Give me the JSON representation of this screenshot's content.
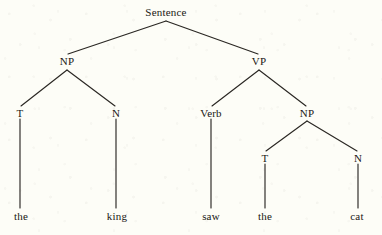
{
  "diagram": {
    "type": "constituency-syntax-tree",
    "sentence_text": "the king saw the cat",
    "background_color": "#fdfdf7",
    "ink_color": "#1a1814",
    "line_color": "#2a2723",
    "nodes": [
      {
        "id": "S",
        "label": "Sentence",
        "x": 166,
        "y": 12,
        "kind": "root"
      },
      {
        "id": "NP1",
        "label": "NP",
        "x": 67,
        "y": 61,
        "kind": "phrase"
      },
      {
        "id": "VP",
        "label": "VP",
        "x": 259,
        "y": 61,
        "kind": "phrase"
      },
      {
        "id": "T1",
        "label": "T",
        "x": 20,
        "y": 113,
        "kind": "terminal-cat"
      },
      {
        "id": "N1",
        "label": "N",
        "x": 116,
        "y": 113,
        "kind": "terminal-cat"
      },
      {
        "id": "Verb",
        "label": "Verb",
        "x": 211,
        "y": 113,
        "kind": "terminal-cat"
      },
      {
        "id": "NP2",
        "label": "NP",
        "x": 307,
        "y": 113,
        "kind": "phrase"
      },
      {
        "id": "T2",
        "label": "T",
        "x": 265,
        "y": 158,
        "kind": "terminal-cat"
      },
      {
        "id": "N2",
        "label": "N",
        "x": 358,
        "y": 158,
        "kind": "terminal-cat"
      }
    ],
    "leaves": [
      {
        "id": "w-the1",
        "label": "the",
        "x": 21,
        "y": 216,
        "parent": "T1"
      },
      {
        "id": "w-king",
        "label": "king",
        "x": 117,
        "y": 216,
        "parent": "N1"
      },
      {
        "id": "w-saw",
        "label": "saw",
        "x": 211,
        "y": 216,
        "parent": "Verb"
      },
      {
        "id": "w-the2",
        "label": "the",
        "x": 265,
        "y": 216,
        "parent": "T2"
      },
      {
        "id": "w-cat",
        "label": "cat",
        "x": 357,
        "y": 216,
        "parent": "N2"
      }
    ],
    "edges": [
      {
        "from": "S",
        "to": "NP1",
        "x1": 166,
        "y1": 21,
        "x2": 68,
        "y2": 54
      },
      {
        "from": "S",
        "to": "VP",
        "x1": 166,
        "y1": 21,
        "x2": 258,
        "y2": 54
      },
      {
        "from": "NP1",
        "to": "T1",
        "x1": 67,
        "y1": 70,
        "x2": 21,
        "y2": 106
      },
      {
        "from": "NP1",
        "to": "N1",
        "x1": 67,
        "y1": 70,
        "x2": 115,
        "y2": 106
      },
      {
        "from": "VP",
        "to": "Verb",
        "x1": 259,
        "y1": 70,
        "x2": 212,
        "y2": 106
      },
      {
        "from": "VP",
        "to": "NP2",
        "x1": 259,
        "y1": 70,
        "x2": 306,
        "y2": 106
      },
      {
        "from": "NP2",
        "to": "T2",
        "x1": 307,
        "y1": 121,
        "x2": 266,
        "y2": 151
      },
      {
        "from": "NP2",
        "to": "N2",
        "x1": 307,
        "y1": 121,
        "x2": 357,
        "y2": 151
      },
      {
        "from": "T1",
        "to": "w-the1",
        "x1": 20,
        "y1": 119,
        "x2": 20,
        "y2": 208
      },
      {
        "from": "N1",
        "to": "w-king",
        "x1": 116,
        "y1": 119,
        "x2": 116,
        "y2": 208
      },
      {
        "from": "Verb",
        "to": "w-saw",
        "x1": 211,
        "y1": 119,
        "x2": 211,
        "y2": 208
      },
      {
        "from": "T2",
        "to": "w-the2",
        "x1": 265,
        "y1": 164,
        "x2": 265,
        "y2": 208
      },
      {
        "from": "N2",
        "to": "w-cat",
        "x1": 358,
        "y1": 164,
        "x2": 358,
        "y2": 208
      }
    ]
  }
}
